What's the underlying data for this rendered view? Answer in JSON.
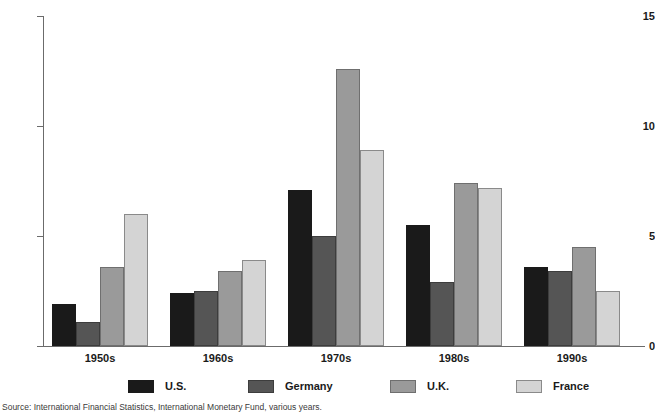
{
  "chart_data": {
    "type": "bar",
    "title": "",
    "xlabel": "",
    "ylabel": "",
    "ylim": [
      0,
      15
    ],
    "yticks": [
      0,
      5,
      10,
      15
    ],
    "ytick_labels": [
      "0",
      "5",
      "10",
      "15"
    ],
    "grid": false,
    "legend_position": "bottom",
    "categories": [
      "1950s",
      "1960s",
      "1970s",
      "1980s",
      "1990s"
    ],
    "series": [
      {
        "name": "U.S.",
        "color": "#1a1a1a",
        "values": [
          1.9,
          2.4,
          7.1,
          5.5,
          3.6
        ]
      },
      {
        "name": "Germany",
        "color": "#555555",
        "values": [
          1.1,
          2.5,
          5.0,
          2.9,
          3.4
        ]
      },
      {
        "name": "U.K.",
        "color": "#9a9a9a",
        "values": [
          3.6,
          3.4,
          12.6,
          7.4,
          4.5
        ]
      },
      {
        "name": "France",
        "color": "#d4d4d4",
        "values": [
          6.0,
          3.9,
          8.9,
          7.2,
          2.5
        ]
      }
    ]
  },
  "legend": {
    "items": [
      {
        "label": "U.S."
      },
      {
        "label": "Germany"
      },
      {
        "label": "U.K."
      },
      {
        "label": "France"
      }
    ]
  },
  "source_note": "Source: International Financial Statistics, International Monetary Fund, various years."
}
